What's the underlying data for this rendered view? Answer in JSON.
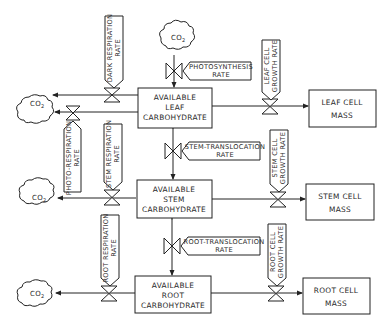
{
  "diagram": {
    "type": "plant carbohydrate flow diagram",
    "pools": {
      "leaf": [
        "AVAILABLE",
        "LEAF",
        "CARBOHYDRATE"
      ],
      "stem": [
        "AVAILABLE",
        "STEM",
        "CARBOHYDRATE"
      ],
      "root": [
        "AVAILABLE",
        "ROOT",
        "CARBOHYDRATE"
      ]
    },
    "masses": {
      "leaf": [
        "LEAF CELL",
        "MASS"
      ],
      "stem": [
        "STEM CELL",
        "MASS"
      ],
      "root": [
        "ROOT CELL",
        "MASS"
      ]
    },
    "rates": {
      "photosynthesis": [
        "PHOTOSYNTHESIS",
        "RATE"
      ],
      "stem_translocation": [
        "STEM-TRANSLOCATION",
        "RATE"
      ],
      "root_translocation": [
        "ROOT-TRANSLOCATION",
        "RATE"
      ],
      "dark_respiration": [
        "DARK  RESPIRATION",
        "RATE"
      ],
      "photo_respiration": [
        "PHOTO-RESPIRATION",
        "RATE"
      ],
      "stem_respiration": [
        "STEM  RESPIRATION",
        "RATE"
      ],
      "root_respiration": [
        "ROOT  RESPIRATION",
        "RATE"
      ],
      "leaf_growth": [
        "LEAF  CELL",
        "GROWTH RATE"
      ],
      "stem_growth": [
        "STEM  CELL",
        "GROWTH RATE"
      ],
      "root_growth": [
        "ROOT  CELL",
        "GROWTH RATE"
      ]
    },
    "co2": {
      "label": "CO",
      "subscript": "2"
    }
  }
}
